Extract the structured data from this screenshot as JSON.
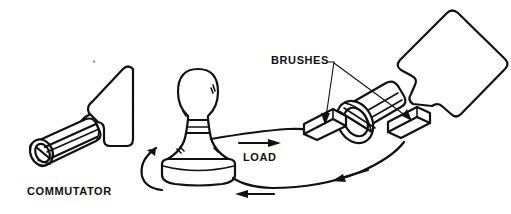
{
  "figure": {
    "background_color": "#ffffff",
    "line_color": "#111111",
    "width": 511,
    "height": 214
  },
  "labels": {
    "commutator": "COMMUTATOR",
    "brushes": "BRUSHES",
    "load": "LOAD"
  },
  "parts": {
    "commutator_detail": "split-ring-cylinder",
    "armature_loop_left": "rounded-quadrilateral-plate",
    "armature_loop_right": "rounded-quadrilateral-plate",
    "lamp": "incandescent-bulb-load",
    "brush_left": "flat-brush-block",
    "brush_right": "flat-brush-block",
    "rotation_indicator": "curved-rotation-arrow",
    "current_arrows": [
      "right-arrow-top-wire",
      "left-arrow-bottom-wire",
      "left-arrow-bottom-wire-2"
    ]
  }
}
